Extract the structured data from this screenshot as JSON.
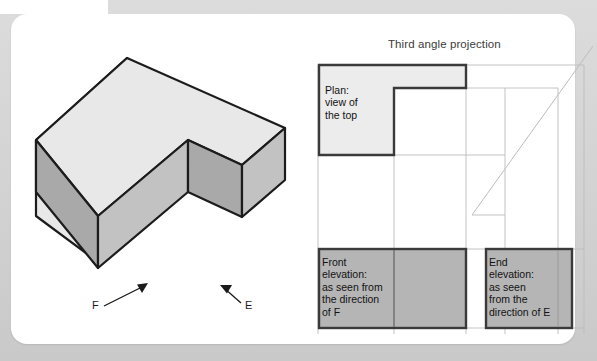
{
  "figure": {
    "title": "Third angle projection",
    "colors": {
      "page_background": "#d6d6d6",
      "card_background": "#ffffff",
      "outline": "#262626",
      "construction_line": "#b9b9b9",
      "plan_fill": "#ececec",
      "elevation_fill": "#b5b5b5",
      "solid_top_face": "#e8e8e8",
      "solid_left_face": "#a9a9a9",
      "solid_front_face": "#c2c2c2",
      "solid_right_face": "#a9a9a9"
    }
  },
  "pictorial": {
    "name": "isometric L-shaped block",
    "direction_arrows": [
      {
        "label": "F",
        "points_to": "front face",
        "direction": "up-right"
      },
      {
        "label": "E",
        "points_to": "end face",
        "direction": "up-left"
      }
    ]
  },
  "views": {
    "plan": {
      "label": "Plan:\nview of\nthe top",
      "shape": "L-shape",
      "fill": "#ececec"
    },
    "front_elevation": {
      "label": "Front\nelevation:\nas seen from\nthe direction\nof F",
      "shape": "rectangle",
      "fill": "#b5b5b5"
    },
    "end_elevation": {
      "label": "End\nelevation:\nas seen\nfrom the\ndirection of E",
      "shape": "rectangle",
      "fill": "#b5b5b5"
    }
  }
}
